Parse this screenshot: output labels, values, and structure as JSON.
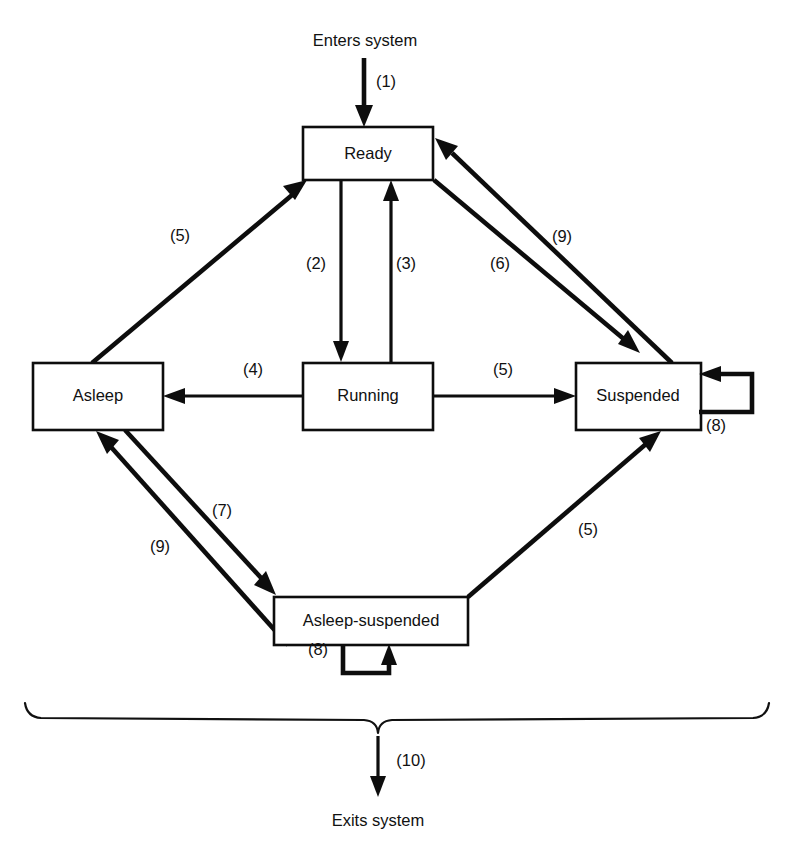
{
  "diagram": {
    "entry_label": "Enters system",
    "exit_label": "Exits system",
    "stroke_color": "#0d0d0d",
    "background_color": "#ffffff",
    "states": [
      {
        "id": "ready",
        "label": "Ready",
        "x": 303,
        "y": 127,
        "w": 130,
        "h": 53
      },
      {
        "id": "asleep",
        "label": "Asleep",
        "x": 33,
        "y": 363,
        "w": 130,
        "h": 67
      },
      {
        "id": "running",
        "label": "Running",
        "x": 303,
        "y": 363,
        "w": 130,
        "h": 67
      },
      {
        "id": "suspended",
        "label": "Suspended",
        "x": 576,
        "y": 363,
        "w": 125,
        "h": 67
      },
      {
        "id": "asleep_suspended",
        "label": "Asleep-suspended",
        "x": 274,
        "y": 597,
        "w": 194,
        "h": 48
      }
    ],
    "transitions": [
      {
        "id": "t1",
        "label": "(1)",
        "from": "entry",
        "to": "ready",
        "label_x": 386,
        "label_y": 83
      },
      {
        "id": "t2",
        "label": "(2)",
        "from": "ready",
        "to": "running",
        "label_x": 316,
        "label_y": 265
      },
      {
        "id": "t3",
        "label": "(3)",
        "from": "running",
        "to": "ready",
        "label_x": 406,
        "label_y": 265
      },
      {
        "id": "t4",
        "label": "(4)",
        "from": "running",
        "to": "asleep",
        "label_x": 253,
        "label_y": 371
      },
      {
        "id": "t5a",
        "label": "(5)",
        "from": "asleep",
        "to": "ready",
        "label_x": 180,
        "label_y": 237
      },
      {
        "id": "t5b",
        "label": "(5)",
        "from": "asleep_suspended",
        "to": "suspended",
        "label_x": 588,
        "label_y": 531
      },
      {
        "id": "t6",
        "label": "(6)",
        "from": "running",
        "to": "suspended",
        "label_x": 503,
        "label_y": 371
      },
      {
        "id": "t7a",
        "label": "(7)",
        "from": "ready",
        "to": "suspended",
        "label_x": 500,
        "label_y": 265
      },
      {
        "id": "t7b",
        "label": "(7)",
        "from": "asleep",
        "to": "asleep_suspended",
        "label_x": 222,
        "label_y": 512
      },
      {
        "id": "t8a",
        "label": "(8)",
        "from": "suspended",
        "to": "suspended",
        "label_x": 716,
        "label_y": 427
      },
      {
        "id": "t8b",
        "label": "(8)",
        "from": "asleep_suspended",
        "to": "asleep_suspended",
        "label_x": 318,
        "label_y": 651
      },
      {
        "id": "t9a",
        "label": "(9)",
        "from": "suspended",
        "to": "ready",
        "label_x": 562,
        "label_y": 238
      },
      {
        "id": "t9b",
        "label": "(9)",
        "from": "asleep_suspended",
        "to": "asleep",
        "label_x": 160,
        "label_y": 548
      },
      {
        "id": "t10",
        "label": "(10)",
        "from": "brace",
        "to": "exit",
        "label_x": 411,
        "label_y": 762
      }
    ]
  }
}
